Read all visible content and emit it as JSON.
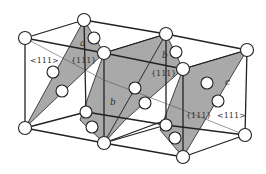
{
  "figure": {
    "type": "crystal-lattice-diagram",
    "planes": [
      {
        "id": "a",
        "label": "a",
        "color": "#a9a9a9"
      },
      {
        "id": "b1",
        "label": "b",
        "color": "#a9a9a9"
      },
      {
        "id": "b2",
        "label": "b",
        "color": "#a9a9a9"
      },
      {
        "id": "c",
        "label": "c",
        "color": "#a9a9a9"
      }
    ],
    "labels": {
      "plane_a": "a",
      "plane_b_top": "b",
      "plane_b_bottom": "b",
      "plane_c": "c",
      "miller_plane_1": "{111}",
      "miller_plane_2": "{111}",
      "miller_plane_3": "{111}",
      "direction_left": "<111>",
      "direction_right": "<111>"
    },
    "colors": {
      "plane_fill": "#a9a9a9",
      "edge": "#222222",
      "atom_fill": "#ffffff",
      "background": "#ffffff"
    }
  }
}
